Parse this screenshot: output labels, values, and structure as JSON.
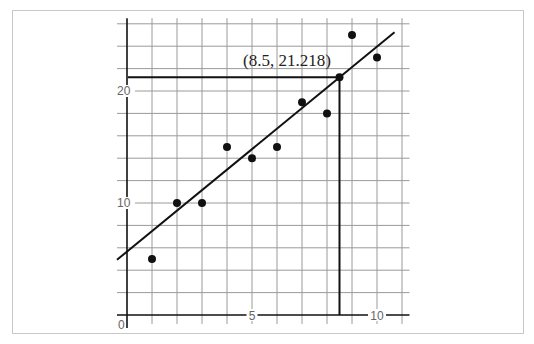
{
  "chart_data": {
    "type": "scatter",
    "title": "",
    "xlabel": "",
    "ylabel": "",
    "xlim": [
      -0.4,
      11.3
    ],
    "ylim": [
      -0.8,
      26.5
    ],
    "grid": true,
    "x_grid_step": 1,
    "y_grid_step": 2,
    "x_ticks": [
      {
        "value": 0,
        "label": "0"
      },
      {
        "value": 5,
        "label": "5"
      },
      {
        "value": 10,
        "label": "10"
      }
    ],
    "y_ticks": [
      {
        "value": 10,
        "label": "10"
      },
      {
        "value": 20,
        "label": "20"
      }
    ],
    "series": [
      {
        "name": "data points",
        "x": [
          1,
          2,
          3,
          4,
          5,
          6,
          7,
          8,
          9,
          10
        ],
        "y": [
          5,
          10,
          10,
          15,
          14,
          15,
          19,
          18,
          25,
          23
        ]
      }
    ],
    "trend_line": {
      "slope": 1.83,
      "intercept": 5.66,
      "x_range": [
        -0.4,
        11.3
      ]
    },
    "annotations": [
      {
        "point": {
          "x": 8.5,
          "y": 21.218
        },
        "label": "(8.5, 21.218)",
        "guide_lines": true
      }
    ],
    "colors": {
      "points": "#111111",
      "line": "#111111",
      "grid": "#9a9a9a",
      "axis": "#111111",
      "frame": "#c8c8c8"
    }
  }
}
